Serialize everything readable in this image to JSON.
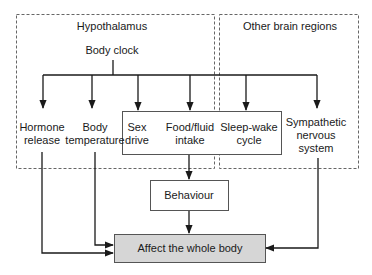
{
  "diagram": {
    "regions": {
      "hypothalamus": "Hypothalamus",
      "other": "Other brain regions"
    },
    "source": "Body clock",
    "outputs": [
      {
        "line1": "Hormone",
        "line2": "release"
      },
      {
        "line1": "Body",
        "line2": "temperature"
      },
      {
        "line1": "Sex",
        "line2": "drive"
      },
      {
        "line1": "Food/fluid",
        "line2": "intake"
      },
      {
        "line1": "Sleep-wake",
        "line2": "cycle"
      },
      {
        "line1": "Sympathetic",
        "line2": "nervous",
        "line3": "system"
      }
    ],
    "behaviour": "Behaviour",
    "target": "Affect the whole body",
    "colors": {
      "line": "#1a1a1a",
      "dashed": "#666666",
      "target_fill": "#d6d6d6"
    }
  }
}
